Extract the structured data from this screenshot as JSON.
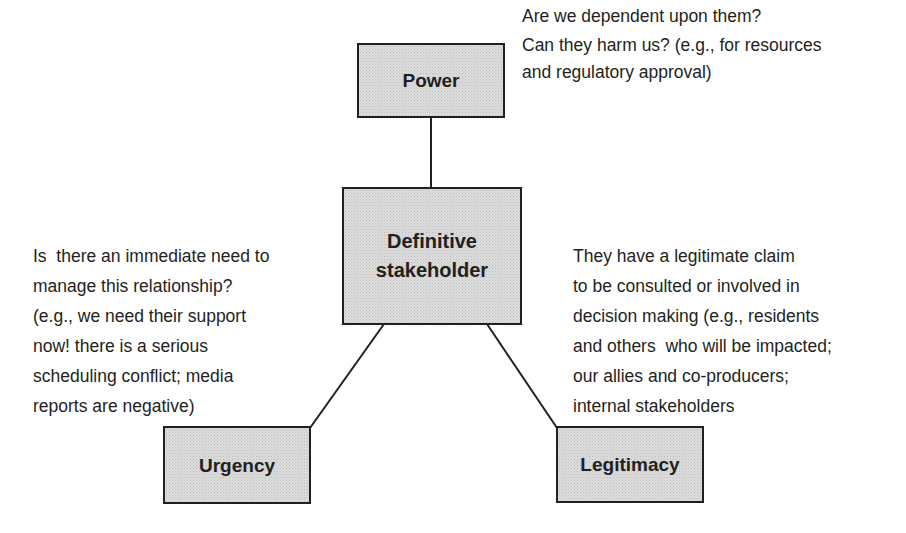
{
  "diagram": {
    "type": "stakeholder salience diagram",
    "nodes": {
      "power": {
        "label": "Power"
      },
      "definitive": {
        "label_lines": [
          "Definitive",
          "stakeholder"
        ]
      },
      "urgency": {
        "label": "Urgency"
      },
      "legitimacy": {
        "label": "Legitimacy"
      }
    },
    "edges": [
      {
        "from": "power",
        "to": "definitive"
      },
      {
        "from": "definitive",
        "to": "urgency"
      },
      {
        "from": "definitive",
        "to": "legitimacy"
      }
    ],
    "annotations": {
      "power": {
        "lines": [
          "Are we dependent upon them?",
          "Can they harm us? (e.g., for resources",
          "and regulatory approval)"
        ]
      },
      "urgency": {
        "lines": [
          "Is  there an immediate need to",
          "manage this relationship?",
          "(e.g., we need their support",
          "now! there is a serious",
          "scheduling conflict; media",
          "reports are negative)"
        ]
      },
      "legitimacy": {
        "lines": [
          "They have a legitimate claim",
          "to be consulted or involved in",
          "decision making (e.g., residents",
          "and others  who will be impacted;",
          "our allies and co-producers;",
          "internal stakeholders"
        ]
      }
    },
    "colors": {
      "box_fill": "#dcdcdc",
      "stroke": "#231f20",
      "text": "#231f20"
    }
  }
}
